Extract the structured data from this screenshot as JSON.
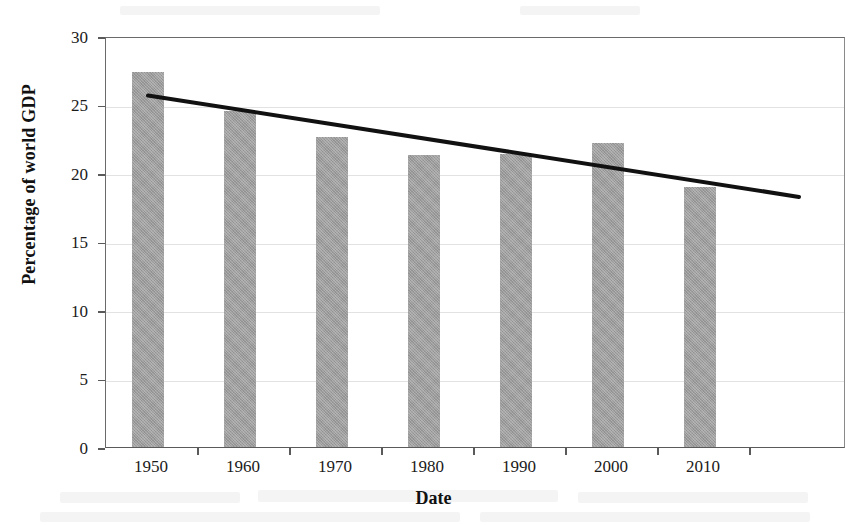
{
  "chart_data": {
    "type": "bar",
    "title": "",
    "xlabel": "Date",
    "ylabel": "Percentage of world GDP",
    "categories": [
      "1950",
      "1960",
      "1970",
      "1980",
      "1990",
      "2000",
      "2010"
    ],
    "values": [
      27.4,
      24.5,
      22.6,
      21.3,
      21.4,
      22.2,
      19.0
    ],
    "series": [
      {
        "name": "Percentage of world GDP",
        "type": "bar",
        "values": [
          27.4,
          24.5,
          22.6,
          21.3,
          21.4,
          22.2,
          19.0
        ]
      },
      {
        "name": "Linear trend",
        "type": "line",
        "start_value": 25.8,
        "end_value": 18.4,
        "start_category": "1950",
        "end_category": "2010"
      }
    ],
    "ylim": [
      0,
      30
    ],
    "ytick_values": [
      0,
      5,
      10,
      15,
      20,
      25,
      30
    ],
    "ytick_labels": [
      "0",
      "5",
      "10",
      "15",
      "20",
      "25",
      "30"
    ],
    "xtick_labels": [
      "1950",
      "1960",
      "1970",
      "1980",
      "1990",
      "2000",
      "2010"
    ],
    "grid": true,
    "grid_axis": "y",
    "legend": false,
    "legend_position": "none",
    "bar_color": "#9d9d9d",
    "trend_color": "#111111"
  },
  "axes": {
    "y_title": "Percentage of world GDP",
    "x_title": "Date"
  }
}
